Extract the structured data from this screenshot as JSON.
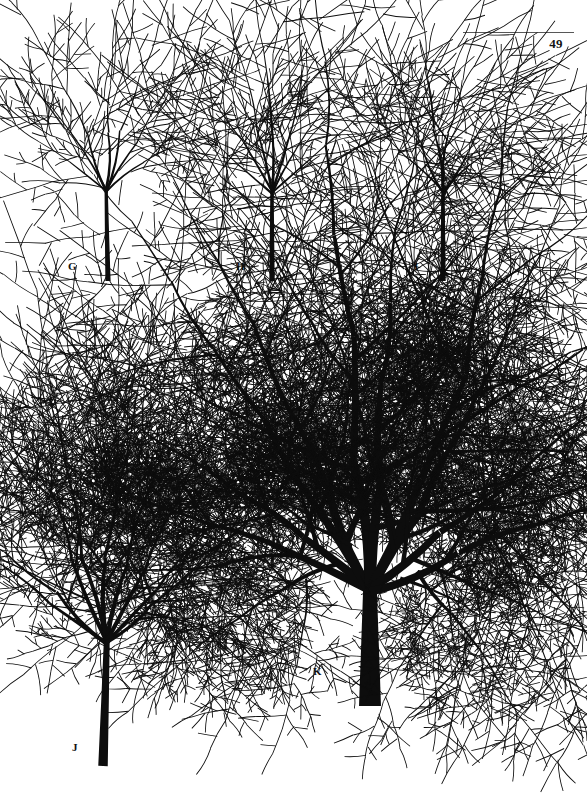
{
  "page": {
    "folio": "49",
    "background_color": "#ffffff",
    "ink_color": "#0d0d0d",
    "rule_color": "#575757",
    "width": 587,
    "height": 799
  },
  "plate": {
    "caption_style": "letter",
    "specimens": [
      {
        "id": "g",
        "label": "G",
        "stage": "sapling",
        "label_x": 68,
        "label_y": 261,
        "origin_x": 108,
        "origin_y": 281,
        "trunk_height": 92,
        "trunk_base_width": 5.2,
        "crown_height": 130,
        "crown_width": 104,
        "depth": 4,
        "branch_count": 7,
        "taper": 0.56,
        "spread": 1.02,
        "droop": 0.1,
        "twig_density": 0.55,
        "seed": 1301,
        "lean": -0.02
      },
      {
        "id": "h",
        "label": "H",
        "stage": "sapling",
        "label_x": 236,
        "label_y": 261,
        "origin_x": 272,
        "origin_y": 281,
        "trunk_height": 90,
        "trunk_base_width": 5.4,
        "crown_height": 136,
        "crown_width": 100,
        "depth": 4,
        "branch_count": 7,
        "taper": 0.56,
        "spread": 0.98,
        "droop": 0.08,
        "twig_density": 0.52,
        "seed": 2207,
        "lean": 0.0
      },
      {
        "id": "i",
        "label": "I",
        "stage": "sapling",
        "label_x": 414,
        "label_y": 261,
        "origin_x": 443,
        "origin_y": 281,
        "trunk_height": 90,
        "trunk_base_width": 5.4,
        "crown_height": 136,
        "crown_width": 96,
        "depth": 4,
        "branch_count": 6,
        "taper": 0.55,
        "spread": 0.95,
        "droop": 0.07,
        "twig_density": 0.45,
        "seed": 3319,
        "lean": 0.0
      },
      {
        "id": "j",
        "label": "J",
        "stage": "young-tree",
        "label_x": 72,
        "label_y": 742,
        "origin_x": 103,
        "origin_y": 766,
        "trunk_height": 125,
        "trunk_base_width": 9.5,
        "crown_height": 190,
        "crown_width": 186,
        "depth": 6,
        "branch_count": 9,
        "taper": 0.64,
        "spread": 1.12,
        "droop": 0.12,
        "twig_density": 1.0,
        "seed": 4423,
        "lean": 0.03
      },
      {
        "id": "k",
        "label": "K",
        "stage": "mature-tree",
        "label_x": 313,
        "label_y": 666,
        "origin_x": 370,
        "origin_y": 706,
        "trunk_height": 118,
        "trunk_base_width": 22,
        "crown_height": 250,
        "crown_width": 360,
        "depth": 7,
        "branch_count": 10,
        "taper": 0.68,
        "spread": 1.34,
        "droop": 0.14,
        "twig_density": 1.15,
        "seed": 5531,
        "lean": 0.0
      }
    ]
  }
}
